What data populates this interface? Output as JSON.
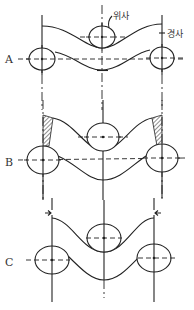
{
  "labels": {
    "weft": "위사",
    "warp": "경사"
  },
  "panels": [
    {
      "id": "A",
      "label": "A"
    },
    {
      "id": "B",
      "label": "B"
    },
    {
      "id": "C",
      "label": "C"
    }
  ],
  "colors": {
    "line": "#222222",
    "background": "#ffffff",
    "hatch": "#444444"
  }
}
